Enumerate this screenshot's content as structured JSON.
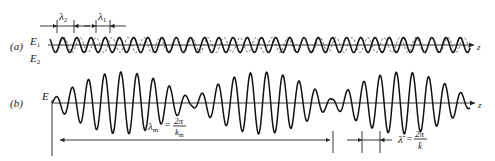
{
  "figure": {
    "part_a": {
      "label": "(a)",
      "wave1_label": "E",
      "wave1_sub": "1",
      "wave2_label": "E",
      "wave2_sub": "2",
      "axis_label": "z",
      "lambda2_label": "λ",
      "lambda2_sub": "2",
      "lambda1_label": "λ",
      "lambda1_sub": "1"
    },
    "part_b": {
      "label": "(b)",
      "wave_label": "E",
      "axis_label": "z",
      "lambda_m_label": "λ",
      "lambda_m_sub": "m",
      "lambda_m_eq": "=",
      "lambda_m_num": "2π",
      "lambda_m_den": "k",
      "lambda_m_den_sub": "m",
      "lambda_bar_label": "λ̄",
      "lambda_bar_eq": "=",
      "lambda_bar_num": "2π",
      "lambda_bar_den": "k̄"
    }
  }
}
